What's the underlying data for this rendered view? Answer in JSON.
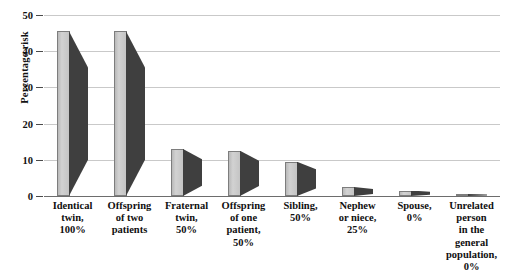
{
  "chart_data": {
    "type": "bar",
    "title": "",
    "xlabel": "",
    "ylabel": "Percentage risk",
    "ylim": [
      0,
      50
    ],
    "ytick_labels": [
      "50",
      "40",
      "30",
      "20",
      "10",
      "0"
    ],
    "yticks": [
      50,
      40,
      30,
      20,
      10,
      0
    ],
    "grid": "horizontal",
    "legend": "none",
    "categories": [
      "Identical twin, 100%",
      "Offspring of two patients",
      "Fraternal twin, 50%",
      "Offspring of one patient, 50%",
      "Sibling, 50%",
      "Nephew or niece, 25%",
      "Spouse, 0%",
      "Unrelated person in the general population, 0%"
    ],
    "category_lines": [
      [
        "Identical",
        "twin,",
        "100%"
      ],
      [
        "Offspring",
        "of two",
        "patients"
      ],
      [
        "Fraternal",
        "twin,",
        "50%"
      ],
      [
        "Offspring",
        "of one",
        "patient,",
        "50%"
      ],
      [
        "Sibling,",
        "50%"
      ],
      [
        "Nephew",
        "or niece,",
        "25%"
      ],
      [
        "Spouse,",
        "0%"
      ],
      [
        "Unrelated",
        "person",
        "in the",
        "general",
        "population, 0%"
      ]
    ],
    "values": [
      45.5,
      45.5,
      13,
      12.5,
      9.5,
      2.5,
      1.5,
      0.5
    ],
    "bar_style": "3d-wedge",
    "colors": {
      "bar_front": "#c8c8c8",
      "bar_side": "#3f3f3f",
      "bar_outline": "#7d7d7d",
      "gridline": "#c9c9c9",
      "axis": "#6d6d6d",
      "background": "#ffffff",
      "text": "#101010"
    }
  }
}
